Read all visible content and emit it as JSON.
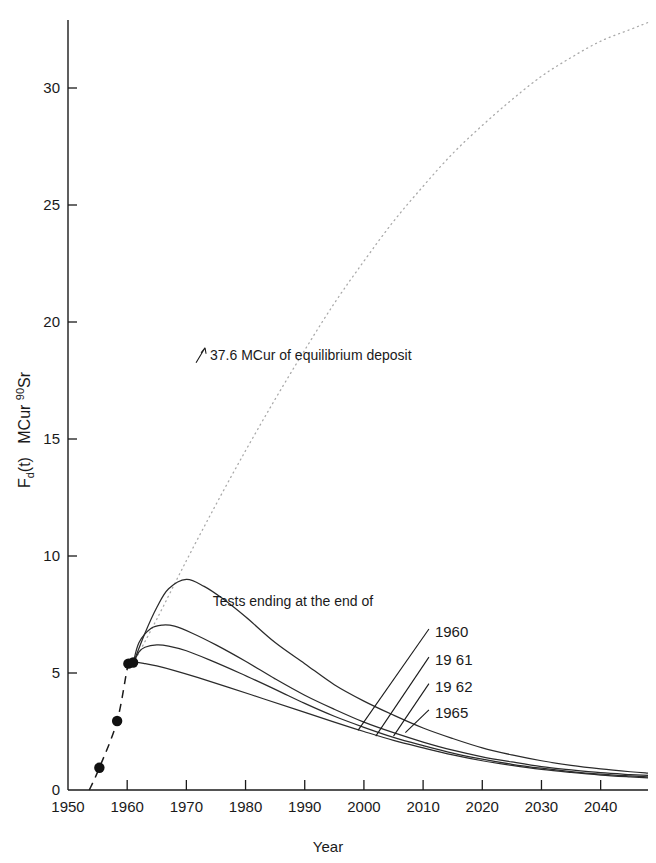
{
  "chart_data": {
    "type": "line",
    "title": "",
    "xlabel": "Year",
    "ylabel": "F_d(t)   MCur 90Sr",
    "ylabel_parts": {
      "main": "F",
      "sub": "d",
      "paren": "(t)",
      "unit": "MCur",
      "iso_sup": "90",
      "iso": "Sr"
    },
    "xlim": [
      1950,
      2048
    ],
    "ylim": [
      0,
      33
    ],
    "grid": false,
    "legend_position": "inline-leader-labels",
    "xticks": [
      1950,
      1960,
      1970,
      1980,
      1990,
      2000,
      2010,
      2020,
      2030,
      2040
    ],
    "xticklabels": [
      "1950",
      "1960",
      "1970",
      "1980",
      "1990",
      "2000",
      "2010",
      "2020",
      "2030",
      "2040"
    ],
    "yticks": [
      0,
      5,
      10,
      15,
      20,
      25,
      30
    ],
    "yticklabels": [
      "0",
      "5",
      "10",
      "15",
      "20",
      "25",
      "30"
    ],
    "annotations": [
      {
        "name": "equilibrium-annotation",
        "text": "37.6 MCur of equilibrium deposit",
        "x": 1974,
        "y": 18.6,
        "arrow": true
      },
      {
        "name": "legend-caption",
        "text": "Tests ending at the end of",
        "x": 1988,
        "y": 7.85,
        "arrow": false
      }
    ],
    "measured_points": {
      "name": "Measured deposit",
      "marker": "filled-circle",
      "x": [
        1955.3,
        1958.3,
        1960.2,
        1961.0
      ],
      "y": [
        0.95,
        2.95,
        5.4,
        5.45
      ]
    },
    "series": [
      {
        "name": "equilibrium",
        "label": "37.6 MCur of equilibrium deposit",
        "style": "dotted",
        "color": "#a9a9a9",
        "x": [
          1961,
          1965,
          1970,
          1975,
          1980,
          1985,
          1990,
          1995,
          2000,
          2005,
          2010,
          2015,
          2020,
          2025,
          2030,
          2035,
          2040,
          2045,
          2048
        ],
        "y": [
          5.4,
          7.3,
          9.8,
          12.2,
          14.5,
          16.7,
          18.8,
          20.8,
          22.6,
          24.3,
          25.8,
          27.2,
          28.4,
          29.5,
          30.5,
          31.3,
          32.0,
          32.5,
          32.8
        ]
      },
      {
        "name": "tests-1965",
        "label": "1965",
        "style": "solid",
        "color": "#2b2b2b",
        "x": [
          1961,
          1963,
          1965,
          1967,
          1970,
          1973,
          1976,
          1980,
          1985,
          1990,
          1995,
          2000,
          2005,
          2010,
          2015,
          2020,
          2025,
          2030,
          2035,
          2040,
          2045,
          2048
        ],
        "y": [
          5.4,
          6.7,
          7.8,
          8.6,
          9.0,
          8.7,
          8.2,
          7.4,
          6.3,
          5.4,
          4.5,
          3.8,
          3.2,
          2.65,
          2.2,
          1.8,
          1.5,
          1.25,
          1.05,
          0.9,
          0.78,
          0.72
        ]
      },
      {
        "name": "tests-1962",
        "label": "1962",
        "style": "solid",
        "color": "#2b2b2b",
        "x": [
          1961,
          1962,
          1964,
          1966,
          1968,
          1971,
          1975,
          1980,
          1985,
          1990,
          1995,
          2000,
          2005,
          2010,
          2015,
          2020,
          2025,
          2030,
          2035,
          2040,
          2045,
          2048
        ],
        "y": [
          5.4,
          6.3,
          6.9,
          7.05,
          7.0,
          6.7,
          6.2,
          5.5,
          4.75,
          4.05,
          3.45,
          2.9,
          2.45,
          2.05,
          1.7,
          1.42,
          1.2,
          1.0,
          0.86,
          0.74,
          0.66,
          0.62
        ]
      },
      {
        "name": "tests-1961",
        "label": "1961",
        "style": "solid",
        "color": "#2b2b2b",
        "x": [
          1961,
          1962,
          1963,
          1965,
          1967,
          1970,
          1974,
          1979,
          1985,
          1990,
          1995,
          2000,
          2005,
          2010,
          2015,
          2020,
          2025,
          2030,
          2035,
          2040,
          2045,
          2048
        ],
        "y": [
          5.4,
          5.9,
          6.1,
          6.2,
          6.15,
          5.95,
          5.55,
          5.0,
          4.3,
          3.7,
          3.15,
          2.68,
          2.25,
          1.9,
          1.58,
          1.32,
          1.1,
          0.93,
          0.79,
          0.68,
          0.6,
          0.56
        ]
      },
      {
        "name": "tests-1960",
        "label": "1960",
        "style": "solid",
        "color": "#2b2b2b",
        "x": [
          1960.5,
          1961.5,
          1963,
          1965,
          1968,
          1972,
          1977,
          1983,
          1989,
          1995,
          2000,
          2005,
          2010,
          2015,
          2020,
          2025,
          2030,
          2035,
          2040,
          2045,
          2048
        ],
        "y": [
          5.4,
          5.45,
          5.4,
          5.3,
          5.1,
          4.8,
          4.4,
          3.9,
          3.4,
          2.9,
          2.5,
          2.12,
          1.8,
          1.5,
          1.25,
          1.05,
          0.88,
          0.75,
          0.64,
          0.56,
          0.52
        ]
      }
    ],
    "series_labels": [
      {
        "name": "label-1960",
        "text": "1960",
        "label_x": 2012,
        "label_y": 6.75,
        "target_x": 1999,
        "target_y": 2.55
      },
      {
        "name": "label-1961",
        "text": "19 61",
        "label_x": 2012,
        "label_y": 5.55,
        "target_x": 2002,
        "target_y": 2.3
      },
      {
        "name": "label-1962",
        "text": "19 62",
        "label_x": 2012,
        "label_y": 4.42,
        "target_x": 2005,
        "target_y": 2.3
      },
      {
        "name": "label-1965",
        "text": "1965",
        "label_x": 2012,
        "label_y": 3.3,
        "target_x": 2007,
        "target_y": 2.45
      }
    ]
  }
}
